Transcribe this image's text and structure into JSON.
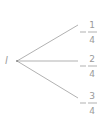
{
  "diagram": {
    "type": "tree",
    "root": {
      "label": "l"
    },
    "branches": [
      {
        "sign": "−",
        "numerator": "1",
        "denominator": "4"
      },
      {
        "sign": "−",
        "numerator": "2",
        "denominator": "4"
      },
      {
        "sign": "−",
        "numerator": "3",
        "denominator": "4"
      }
    ],
    "colors": {
      "line": "#a0a0a0",
      "text": "#9a9a9a"
    }
  }
}
